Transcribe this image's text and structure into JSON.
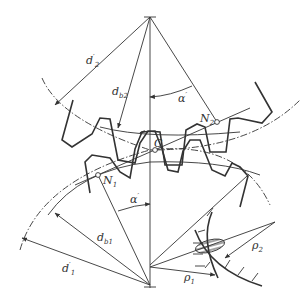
{
  "diagram": {
    "type": "gear-meshing-geometry",
    "labels": {
      "d2_pitch": {
        "base": "d",
        "sup": "′",
        "sub": "2"
      },
      "db2_base": {
        "base": "d",
        "sub": "b2"
      },
      "alpha_top": {
        "base": "α",
        "sup": "′"
      },
      "N2": {
        "base": "N",
        "sub": "2"
      },
      "C": {
        "base": "C"
      },
      "N1": {
        "base": "N",
        "sub": "1"
      },
      "alpha_bottom": {
        "base": "α",
        "sup": "′"
      },
      "db1_base": {
        "base": "d",
        "sub": "b1"
      },
      "d1_pitch": {
        "base": "d",
        "sup": "′",
        "sub": "1"
      },
      "rho2": {
        "base": "ρ",
        "sub": "2"
      },
      "rho1": {
        "base": "ρ",
        "sub": "1"
      }
    },
    "points": {
      "O2_top_center": [
        150,
        17
      ],
      "O1_bottom_center": [
        150,
        285
      ],
      "C_pitch_point": [
        155,
        150
      ],
      "N1": [
        98,
        175
      ],
      "N2": [
        217,
        122
      ]
    },
    "colors": {
      "stroke": "#333333",
      "background": "#ffffff"
    }
  }
}
